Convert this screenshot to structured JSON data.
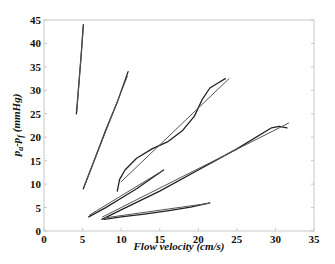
{
  "chart_data": {
    "type": "line",
    "title": "",
    "xlabel": "Flow velocity (cm/s)",
    "ylabel": "p_a-p_f (mmHg)",
    "xlim": [
      0,
      35
    ],
    "ylim": [
      0,
      45
    ],
    "xticks": [
      0,
      5,
      10,
      15,
      20,
      25,
      30,
      35
    ],
    "yticks": [
      0,
      5,
      10,
      15,
      20,
      25,
      30,
      35,
      40,
      45
    ],
    "grid": false,
    "legend": null,
    "series": [
      {
        "name": "curve-1",
        "x": [
          4.2,
          4.5,
          4.8,
          5.1
        ],
        "y": [
          25,
          31,
          37,
          44
        ]
      },
      {
        "name": "curve-1-fit",
        "x": [
          4.25,
          5.1
        ],
        "y": [
          25.5,
          43.5
        ]
      },
      {
        "name": "curve-2",
        "x": [
          5.1,
          6.5,
          8,
          9.5,
          10.9
        ],
        "y": [
          9,
          15,
          21.5,
          27.5,
          34
        ]
      },
      {
        "name": "curve-2-fit",
        "x": [
          5.2,
          10.8
        ],
        "y": [
          9.5,
          33
        ]
      },
      {
        "name": "curve-3",
        "x": [
          9.5,
          9.8,
          10.5,
          12,
          14,
          16,
          18,
          19.5,
          20.5,
          21.5,
          22.5,
          23.5
        ],
        "y": [
          8.5,
          11,
          13,
          15.5,
          17.5,
          19,
          21.5,
          24.5,
          28,
          30.5,
          31.5,
          32.5
        ]
      },
      {
        "name": "curve-3-fit",
        "x": [
          10,
          24
        ],
        "y": [
          10.5,
          32.5
        ]
      },
      {
        "name": "curve-4",
        "x": [
          5.8,
          8,
          10,
          12,
          14,
          15.5
        ],
        "y": [
          3,
          5,
          7,
          9,
          11.3,
          13
        ]
      },
      {
        "name": "curve-4-fit",
        "x": [
          5.9,
          15.3
        ],
        "y": [
          3.4,
          12.8
        ]
      },
      {
        "name": "curve-5",
        "x": [
          7.5,
          10,
          15,
          20,
          25,
          29.5,
          30.5,
          31.5
        ],
        "y": [
          2.5,
          4.5,
          8.5,
          13,
          17.5,
          22,
          22.3,
          22
        ]
      },
      {
        "name": "curve-5-fit",
        "x": [
          7.6,
          31.7
        ],
        "y": [
          3,
          23
        ]
      },
      {
        "name": "curve-6",
        "x": [
          7.8,
          10,
          13,
          16,
          19,
          21.5
        ],
        "y": [
          2.5,
          3,
          3.6,
          4.3,
          5.1,
          6
        ]
      },
      {
        "name": "curve-6-fit",
        "x": [
          7.9,
          21.4
        ],
        "y": [
          2.8,
          5.9
        ]
      }
    ]
  },
  "plot": {
    "left": 44,
    "right": 314,
    "top": 20,
    "bottom": 231
  }
}
